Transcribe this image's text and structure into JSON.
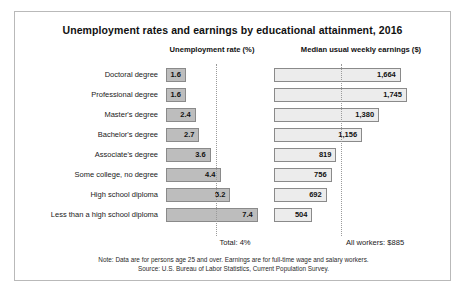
{
  "chart_data": {
    "type": "bar",
    "title": "Unemployment rates and earnings by educational attainment, 2016",
    "orientation": "horizontal",
    "grid": false,
    "legend": "none",
    "panels": [
      {
        "key": "unemployment",
        "header": "Unemployment rate (%)",
        "xlabel": "",
        "ylabel": "",
        "xlim": [
          0,
          7.4
        ],
        "reference_line": {
          "value": 4,
          "label": "Total: 4%"
        }
      },
      {
        "key": "earnings",
        "header": "Median usual weekly earnings ($)",
        "xlabel": "",
        "ylabel": "",
        "xlim": [
          0,
          1745
        ],
        "reference_line": {
          "value": 885,
          "label": "All workers: $885"
        }
      }
    ],
    "categories": [
      "Doctoral degree",
      "Professional degree",
      "Master's degree",
      "Bachelor's degree",
      "Associate's degree",
      "Some college, no degree",
      "High school diploma",
      "Less than a high school diploma"
    ],
    "series": [
      {
        "name": "Unemployment rate (%)",
        "values": [
          1.6,
          1.6,
          2.4,
          2.7,
          3.6,
          4.4,
          5.2,
          7.4
        ],
        "labels": [
          "1.6",
          "1.6",
          "2.4",
          "2.7",
          "3.6",
          "4.4",
          "5.2",
          "7.4"
        ]
      },
      {
        "name": "Median usual weekly earnings ($)",
        "values": [
          1664,
          1745,
          1380,
          1156,
          819,
          756,
          692,
          504
        ],
        "labels": [
          "1,664",
          "1,745",
          "1,380",
          "1,156",
          "819",
          "756",
          "692",
          "504"
        ]
      }
    ],
    "annotations": [
      "Total: 4%",
      "All workers: $885"
    ]
  },
  "footnotes": [
    "Note: Data are for persons age 25 and over. Earnings are for full-time wage and salary workers.",
    "Source: U.S. Bureau of Labor Statistics, Current Population Survey."
  ],
  "caption": "",
  "colors": {
    "unemployment_bar": "#bdbdbd",
    "earnings_bar": "#ececec",
    "bar_border": "#8a8a8a",
    "frame_border": "#b9b9b9",
    "reference_line": "#9a9a9a",
    "text": "#1a1a1a"
  }
}
